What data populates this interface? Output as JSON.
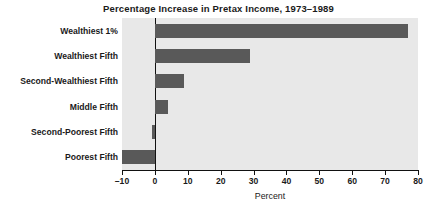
{
  "chart_data": {
    "type": "bar",
    "orientation": "horizontal",
    "title": "Percentage Increase in Pretax Income, 1973–1989",
    "xlabel": "Percent",
    "ylabel": "",
    "categories": [
      "Wealthiest 1%",
      "Wealthiest Fifth",
      "Second-Wealthiest Fifth",
      "Middle Fifth",
      "Second-Poorest Fifth",
      "Poorest Fifth"
    ],
    "values": [
      77,
      29,
      9,
      4,
      -1,
      -10
    ],
    "xlim": [
      -10,
      80
    ],
    "xticks": [
      -10,
      0,
      10,
      20,
      30,
      40,
      50,
      60,
      70,
      80
    ],
    "xtick_labels": [
      "–10",
      "0",
      "10",
      "20",
      "30",
      "40",
      "50",
      "60",
      "70",
      "80"
    ],
    "grid": false,
    "legend": false,
    "bar_color": "#595959",
    "plot_background": "#e8e8e8",
    "zero_line_color": "#111111"
  }
}
